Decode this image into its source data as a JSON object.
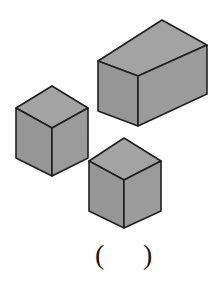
{
  "figure": {
    "style": {
      "background": "#ffffff",
      "face_fill": "#9b9b9b",
      "top_face_fill": "#a3a3a3",
      "side_face_fill": "#969696",
      "outline": "#231f20",
      "outline_width": 1.6
    },
    "solids": [
      {
        "name": "left-cube",
        "label": "left cube",
        "shape": "cube",
        "vertices": {
          "top_apex": [
            52,
            86
          ],
          "top_left": [
            16,
            108
          ],
          "top_right": [
            88,
            108
          ],
          "center": [
            52,
            128
          ],
          "bottom_left": [
            16,
            158
          ],
          "bottom_right": [
            88,
            158
          ],
          "bottom_apex": [
            52,
            176
          ]
        }
      },
      {
        "name": "large-box",
        "label": "large rectangular box",
        "shape": "rectangular-prism",
        "vertices": {
          "top_apex": [
            162,
            20
          ],
          "top_left": [
            98,
            61
          ],
          "top_right": [
            207,
            45
          ],
          "center": [
            138,
            76
          ],
          "bottom_left": [
            98,
            111
          ],
          "bottom_right": [
            207,
            94
          ],
          "bottom_apex": [
            138,
            126
          ]
        }
      },
      {
        "name": "bottom-cube",
        "label": "bottom cube",
        "shape": "cube",
        "vertices": {
          "top_apex": [
            124,
            138
          ],
          "top_left": [
            89,
            161
          ],
          "top_right": [
            161,
            161
          ],
          "center": [
            124,
            180
          ],
          "bottom_left": [
            89,
            211
          ],
          "bottom_right": [
            161,
            211
          ],
          "bottom_apex": [
            124,
            228
          ]
        }
      }
    ]
  },
  "answer": {
    "open_paren": "(",
    "close_paren": ")",
    "value": ""
  }
}
